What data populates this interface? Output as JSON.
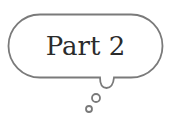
{
  "bubble": {
    "text": "Part 2",
    "stroke_color": "#7a7a7a",
    "text_color": "#2b2b2b",
    "icon": "thought-bubble-icon"
  }
}
